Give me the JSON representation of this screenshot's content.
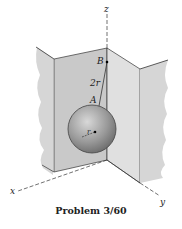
{
  "figure": {
    "caption": "Problem 3/60",
    "labels": {
      "z_axis": "z",
      "x_axis": "x",
      "y_axis": "y",
      "point_b": "B",
      "point_a": "A",
      "cord_length": "2r",
      "radius": "r"
    },
    "colors": {
      "wall_back": "#c9c9c9",
      "wall_side": "#dcdcdc",
      "wall_torn": "#d6d6d6",
      "sphere": "#9a9a9a",
      "line": "#333333"
    }
  }
}
